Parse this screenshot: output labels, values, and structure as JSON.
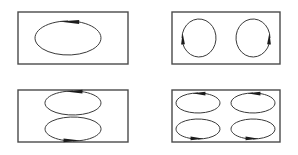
{
  "figure": {
    "background_color": "#ffffff",
    "frame_color": "#4a4a4a",
    "loop_color": "#3a3a3a",
    "arrow_color": "#1c1c1c",
    "panel_count": 4,
    "layout": "2x2 grid of rectangular enclosures"
  },
  "panels": [
    {
      "id": "panel-top-left",
      "position": "top-left",
      "cell_count": 1,
      "cell_arrangement": "1 x 1",
      "frame": {
        "x": 18,
        "y": 12,
        "width": 110,
        "height": 52
      },
      "cells": [
        {
          "id": "cell-1",
          "shape": "ellipse",
          "cx": 68,
          "cy": 38,
          "rx": 33,
          "ry": 17,
          "rotation": "clockwise",
          "arrow_position": "top",
          "arrow_direction": "right"
        }
      ]
    },
    {
      "id": "panel-top-right",
      "position": "top-right",
      "cell_count": 2,
      "cell_arrangement": "2 x 1 side-by-side",
      "frame": {
        "x": 172,
        "y": 12,
        "width": 108,
        "height": 52
      },
      "cells": [
        {
          "id": "cell-1",
          "shape": "circle",
          "cx": 199,
          "cy": 38,
          "rx": 17,
          "ry": 19,
          "rotation": "counter-clockwise",
          "arrow_position": "left",
          "arrow_direction": "down"
        },
        {
          "id": "cell-2",
          "shape": "circle",
          "cx": 253,
          "cy": 38,
          "rx": 17,
          "ry": 19,
          "rotation": "clockwise",
          "arrow_position": "right",
          "arrow_direction": "down"
        }
      ]
    },
    {
      "id": "panel-bottom-left",
      "position": "bottom-left",
      "cell_count": 2,
      "cell_arrangement": "1 x 2 stacked",
      "frame": {
        "x": 18,
        "y": 90,
        "width": 110,
        "height": 52
      },
      "cells": [
        {
          "id": "cell-1",
          "shape": "ellipse",
          "cx": 73,
          "cy": 103,
          "rx": 28,
          "ry": 12,
          "rotation": "clockwise",
          "arrow_position": "top",
          "arrow_direction": "right"
        },
        {
          "id": "cell-2",
          "shape": "ellipse",
          "cx": 73,
          "cy": 129,
          "rx": 28,
          "ry": 12,
          "rotation": "clockwise",
          "arrow_position": "bottom",
          "arrow_direction": "left"
        }
      ]
    },
    {
      "id": "panel-bottom-right",
      "position": "bottom-right",
      "cell_count": 4,
      "cell_arrangement": "2 x 2 grid",
      "frame": {
        "x": 172,
        "y": 90,
        "width": 108,
        "height": 52
      },
      "cells": [
        {
          "id": "cell-1",
          "shape": "ellipse",
          "cx": 198,
          "cy": 103,
          "rx": 22,
          "ry": 10,
          "rotation": "clockwise",
          "arrow_position": "top",
          "arrow_direction": "right"
        },
        {
          "id": "cell-2",
          "shape": "ellipse",
          "cx": 253,
          "cy": 103,
          "rx": 22,
          "ry": 10,
          "rotation": "clockwise",
          "arrow_position": "top",
          "arrow_direction": "right"
        },
        {
          "id": "cell-3",
          "shape": "ellipse",
          "cx": 198,
          "cy": 129,
          "rx": 22,
          "ry": 10,
          "rotation": "clockwise",
          "arrow_position": "bottom",
          "arrow_direction": "left"
        },
        {
          "id": "cell-4",
          "shape": "ellipse",
          "cx": 253,
          "cy": 129,
          "rx": 22,
          "ry": 10,
          "rotation": "clockwise",
          "arrow_position": "bottom",
          "arrow_direction": "left"
        }
      ]
    }
  ]
}
